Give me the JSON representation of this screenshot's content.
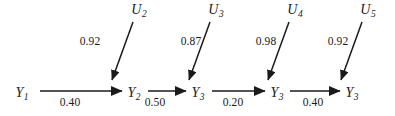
{
  "diagram": {
    "type": "path-diagram",
    "background_color": "#ffffff",
    "stroke_color": "#1a1a1a",
    "nodes": [
      {
        "id": "y1",
        "base": "Y",
        "subscript": "1",
        "x": 22,
        "y": 94
      },
      {
        "id": "y2",
        "base": "Y",
        "subscript": "2",
        "x": 134,
        "y": 94
      },
      {
        "id": "y3",
        "base": "Y",
        "subscript": "3",
        "x": 198,
        "y": 94
      },
      {
        "id": "y4",
        "base": "Y",
        "subscript": "3",
        "x": 277,
        "y": 94
      },
      {
        "id": "y5",
        "base": "Y",
        "subscript": "3",
        "x": 352,
        "y": 94
      },
      {
        "id": "u2",
        "base": "U",
        "subscript": "2",
        "x": 139,
        "y": 11
      },
      {
        "id": "u3",
        "base": "U",
        "subscript": "3",
        "x": 216,
        "y": 11
      },
      {
        "id": "u4",
        "base": "U",
        "subscript": "4",
        "x": 295,
        "y": 11
      },
      {
        "id": "u5",
        "base": "U",
        "subscript": "5",
        "x": 368,
        "y": 11
      }
    ],
    "edges": [
      {
        "id": "e-y1-y2",
        "from": "y1",
        "to": "y2",
        "orientation": "horizontal",
        "x1": 40,
        "y1": 91,
        "x2": 122,
        "y2": 91,
        "label": "0.40",
        "label_x": 70,
        "label_y": 103
      },
      {
        "id": "e-y2-y3",
        "from": "y2",
        "to": "y3",
        "orientation": "horizontal",
        "x1": 148,
        "y1": 91,
        "x2": 186,
        "y2": 91,
        "label": "0.50",
        "label_x": 155,
        "label_y": 103
      },
      {
        "id": "e-y3-y4",
        "from": "y3",
        "to": "y4",
        "orientation": "horizontal",
        "x1": 212,
        "y1": 91,
        "x2": 265,
        "y2": 91,
        "label": "0.20",
        "label_x": 233,
        "label_y": 103
      },
      {
        "id": "e-y4-y5",
        "from": "y4",
        "to": "y5",
        "orientation": "horizontal",
        "x1": 290,
        "y1": 91,
        "x2": 340,
        "y2": 91,
        "label": "0.40",
        "label_x": 313,
        "label_y": 103
      },
      {
        "id": "e-u2-y2",
        "from": "u2",
        "to": "y2",
        "orientation": "diagonal",
        "x1": 133,
        "y1": 22,
        "x2": 112,
        "y2": 80,
        "label": "0.92",
        "label_x": 90,
        "label_y": 42
      },
      {
        "id": "e-u3-y3",
        "from": "u3",
        "to": "y3",
        "orientation": "diagonal",
        "x1": 210,
        "y1": 22,
        "x2": 189,
        "y2": 80,
        "label": "0.87",
        "label_x": 191,
        "label_y": 42
      },
      {
        "id": "e-u4-y4",
        "from": "u4",
        "to": "y4",
        "orientation": "diagonal",
        "x1": 289,
        "y1": 22,
        "x2": 268,
        "y2": 80,
        "label": "0.98",
        "label_x": 266,
        "label_y": 42
      },
      {
        "id": "e-u5-y5",
        "from": "u5",
        "to": "y5",
        "orientation": "diagonal",
        "x1": 362,
        "y1": 22,
        "x2": 341,
        "y2": 80,
        "label": "0.92",
        "label_x": 338,
        "label_y": 42
      }
    ]
  }
}
